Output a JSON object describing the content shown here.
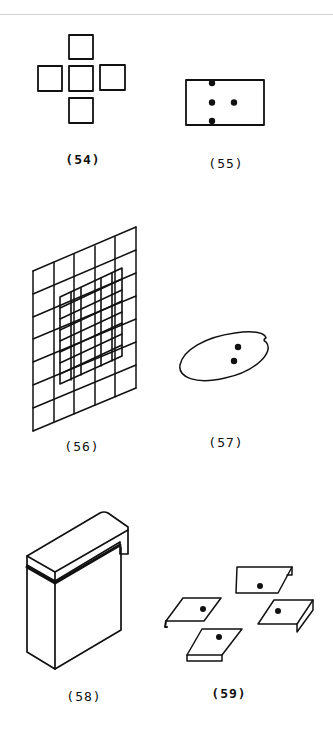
{
  "page": {
    "background": "#ffffff",
    "rule_color": "#d4d4d4",
    "ink_color": "#111111"
  },
  "figures": [
    {
      "id": "54",
      "label": "(54)",
      "description": "five squares arranged in a cross"
    },
    {
      "id": "55",
      "label": "(55)",
      "description": "rectangle with four dots, two on edges"
    },
    {
      "id": "56",
      "label": "(56)",
      "description": "skewed coarse grid overlaid with finer inner grid"
    },
    {
      "id": "57",
      "label": "(57)",
      "description": "tilted ellipse with two dots and a notch"
    },
    {
      "id": "58",
      "label": "(58)",
      "description": "isometric box with overhanging lid"
    },
    {
      "id": "59",
      "label": "(59)",
      "description": "four tilted tabs with bent edges, each with a dot"
    }
  ]
}
